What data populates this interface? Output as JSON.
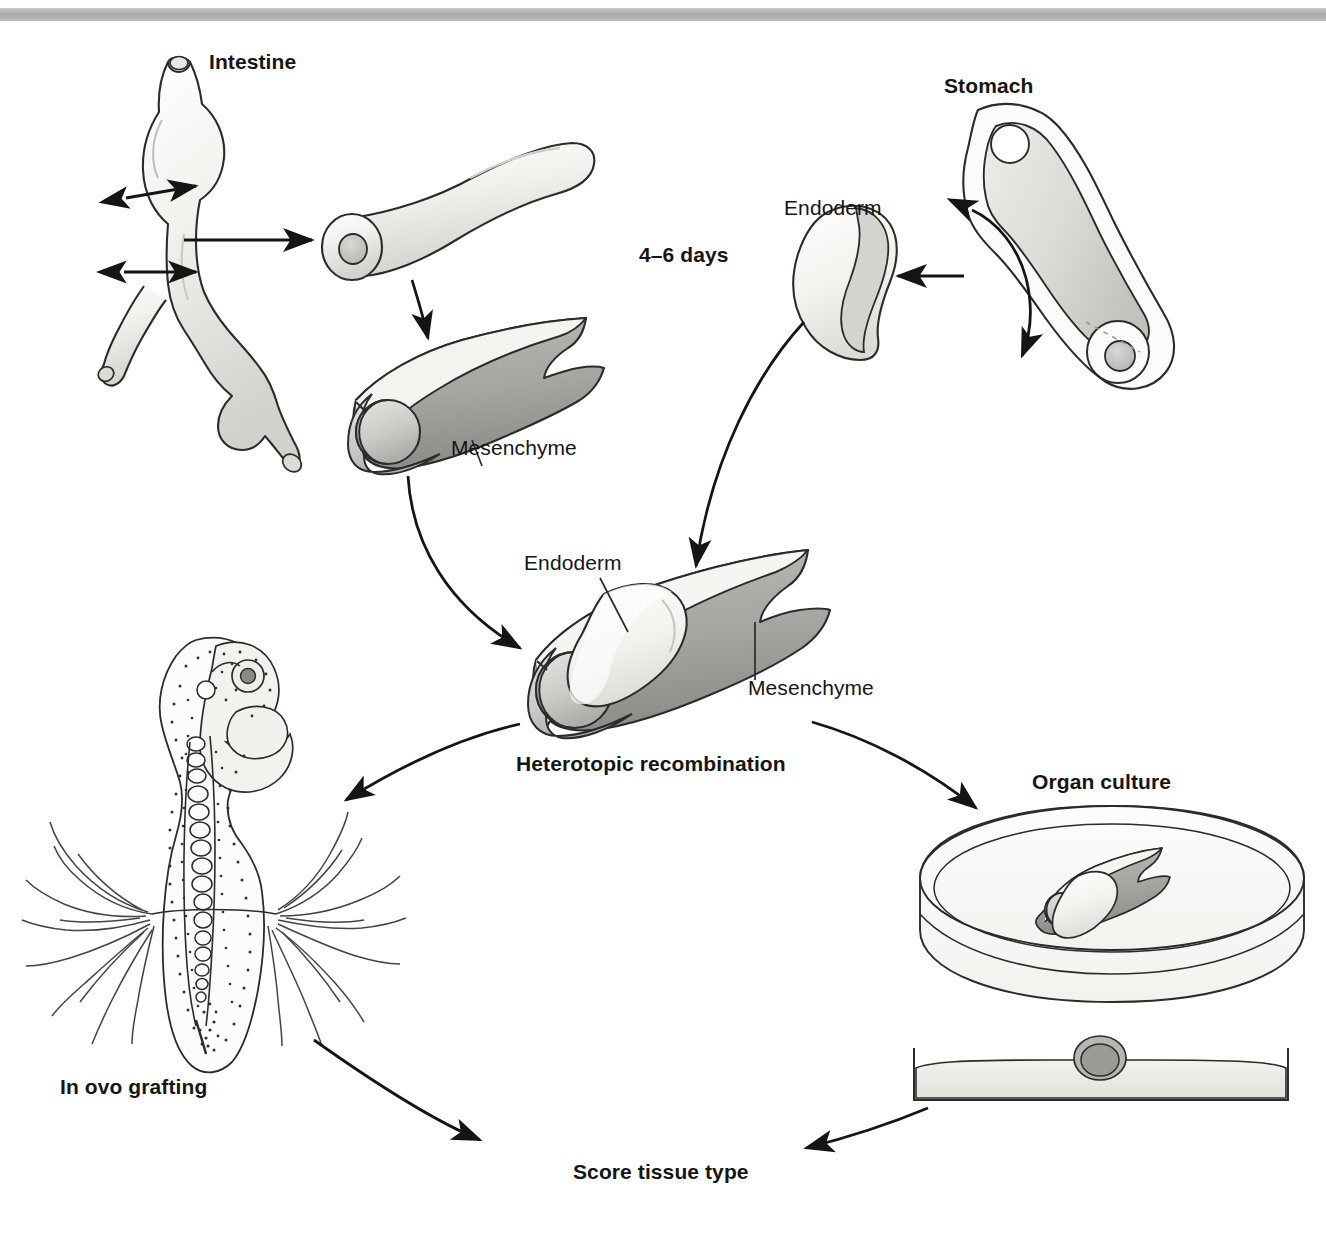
{
  "figure": {
    "domain": "diagram",
    "background_color": "#ffffff",
    "ink_color": "#151515",
    "header_rule_color": "#a9a9a9"
  },
  "palette": {
    "endoderm_fill": "#f0efec",
    "mesenchyme_fill": "#a9a8a4",
    "mesenchyme_fill_light": "#c9c8c4",
    "organ_fill": "#eceae6",
    "outline": "#2b2b2b",
    "dish_fill": "#fbfbfa",
    "medium_fill": "#e9e8e4"
  },
  "labels": {
    "intestine": "Intestine",
    "stomach": "Stomach",
    "days": "4–6 days",
    "endoderm_top": "Endoderm",
    "mesenchyme_top": "Mesenchyme",
    "endoderm_center": "Endoderm",
    "mesenchyme_center": "Mesenchyme",
    "heterotopic_recombination": "Heterotopic recombination",
    "in_ovo_grafting": "In ovo grafting",
    "organ_culture": "Organ culture",
    "score_tissue_type": "Score tissue type"
  },
  "label_styles": {
    "intestine": "bold",
    "stomach": "bold",
    "days": "bold",
    "endoderm_top": "regular",
    "mesenchyme_top": "regular",
    "endoderm_center": "regular",
    "mesenchyme_center": "regular",
    "heterotopic_recombination": "bold",
    "in_ovo_grafting": "bold",
    "organ_culture": "bold",
    "score_tissue_type": "bold"
  },
  "steps": [
    {
      "id": "intestine-source",
      "label": "Intestine",
      "note": "whole embryonic gut with bulge and caecal branch"
    },
    {
      "id": "intestine-segment",
      "label": "",
      "note": "isolated intestinal tube segment, cut end shows lumen"
    },
    {
      "id": "intestine-mesenchyme",
      "label": "Mesenchyme",
      "note": "split mesenchymal sleeve from intestine"
    },
    {
      "id": "stomach-source",
      "label": "Stomach",
      "note": "whole embryonic stomach"
    },
    {
      "id": "stomach-endoderm",
      "label": "Endoderm",
      "note": "isolated stomach endoderm piece"
    },
    {
      "id": "recombination",
      "label": "Heterotopic recombination",
      "note": "stomach endoderm inserted into intestinal mesenchyme"
    },
    {
      "id": "in-ovo",
      "label": "In ovo grafting",
      "note": "graft onto chick embryo chorioallantoic membrane"
    },
    {
      "id": "organ-culture",
      "label": "Organ culture",
      "note": "explant cultured in a petri dish"
    },
    {
      "id": "score",
      "label": "Score tissue type",
      "note": "final readout of differentiated tissue identity"
    }
  ],
  "arrows": [
    {
      "from": "intestine-source",
      "to": "intestine-segment",
      "style": "straight"
    },
    {
      "from": "intestine-segment",
      "to": "intestine-mesenchyme",
      "style": "curved"
    },
    {
      "from": "stomach-source",
      "to": "stomach-endoderm",
      "style": "straight"
    },
    {
      "from": "stomach-endoderm",
      "to": "recombination",
      "style": "curved"
    },
    {
      "from": "intestine-mesenchyme",
      "to": "recombination",
      "style": "curved"
    },
    {
      "from": "recombination",
      "to": "in-ovo",
      "style": "curved"
    },
    {
      "from": "recombination",
      "to": "organ-culture",
      "style": "curved"
    },
    {
      "from": "in-ovo",
      "to": "score",
      "style": "curved"
    },
    {
      "from": "organ-culture",
      "to": "score",
      "style": "curved"
    }
  ],
  "markers": [
    {
      "id": "cut-marker-upper",
      "note": "double-headed arrow marking upper cut plane on intestine"
    },
    {
      "id": "cut-marker-lower",
      "note": "double-headed arrow marking lower cut plane on intestine"
    },
    {
      "id": "stomach-dissection-arrow",
      "note": "curved double-headed arrow through stomach wall"
    }
  ]
}
